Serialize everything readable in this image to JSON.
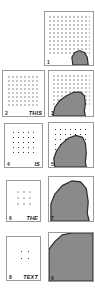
{
  "figure": {
    "caption_words": [
      "THIS",
      "IS",
      "THE",
      "TEXT"
    ],
    "gray_fill": "#8a8a8a",
    "outline": "#2b2b2b",
    "border": "#9a9a9a",
    "background": "#ffffff"
  },
  "panels": [
    {
      "id": "panel-1",
      "index_label": "1",
      "word_label": "",
      "column": "right",
      "row": 1,
      "x": 44,
      "y": 11,
      "w": 50,
      "h": 55,
      "dot_spacing": 4,
      "dot_size": 1,
      "dot_inset": 3,
      "has_dots": true,
      "region_path": "M 29 55 L 28 47 L 31 42 L 36 40 L 41 42 L 44 47 L 45 55 Z",
      "region_coverage_pct": 8
    },
    {
      "id": "panel-2",
      "index_label": "2",
      "word_label": "THIS",
      "column": "left",
      "row": 2,
      "x": 2,
      "y": 70,
      "w": 43,
      "h": 47,
      "dot_spacing": 4,
      "dot_size": 1,
      "dot_inset": 4,
      "has_dots": true,
      "region_path": "",
      "region_coverage_pct": 0
    },
    {
      "id": "panel-3",
      "index_label": "3",
      "word_label": "",
      "column": "right",
      "row": 2,
      "x": 48,
      "y": 70,
      "w": 46,
      "h": 47,
      "dot_spacing": 4,
      "dot_size": 1,
      "dot_inset": 3,
      "has_dots": true,
      "region_path": "M 4 47 L 6 38 L 11 31 L 18 26 L 26 22 L 33 22 L 37 26 L 38 34 L 37 42 L 38 47 Z",
      "region_coverage_pct": 32
    },
    {
      "id": "panel-4",
      "index_label": "4",
      "word_label": "IS",
      "column": "left",
      "row": 3,
      "x": 4,
      "y": 123,
      "w": 39,
      "h": 45,
      "dot_spacing": 5,
      "dot_size": 1,
      "dot_inset": 6,
      "has_dots": true,
      "region_path": "",
      "region_coverage_pct": 0
    },
    {
      "id": "panel-5",
      "index_label": "5",
      "word_label": "",
      "column": "right",
      "row": 3,
      "x": 48,
      "y": 122,
      "w": 46,
      "h": 46,
      "dot_spacing": 5,
      "dot_size": 1,
      "dot_inset": 4,
      "has_dots": true,
      "region_path": "M 6 46 L 5 37 L 8 29 L 13 22 L 20 16 L 28 13 L 35 15 L 38 21 L 39 32 L 38 41 L 39 46 Z",
      "region_coverage_pct": 52
    },
    {
      "id": "panel-6",
      "index_label": "6",
      "word_label": "THE",
      "column": "left",
      "row": 4,
      "x": 6,
      "y": 180,
      "w": 35,
      "h": 42,
      "dot_spacing": 6,
      "dot_size": 1,
      "dot_inset": 8,
      "has_dots": true,
      "region_path": "",
      "region_coverage_pct": 0
    },
    {
      "id": "panel-7",
      "index_label": "7",
      "word_label": "",
      "column": "right",
      "row": 4,
      "x": 48,
      "y": 176,
      "w": 46,
      "h": 46,
      "dot_spacing": 6,
      "dot_size": 1,
      "dot_inset": 5,
      "has_dots": false,
      "region_path": "M 2 46 L 2 28 L 6 18 L 14 9 L 24 4 L 33 5 L 39 12 L 41 26 L 40 38 L 42 46 Z",
      "region_coverage_pct": 74
    },
    {
      "id": "panel-8",
      "index_label": "8",
      "word_label": "TEXT",
      "column": "left",
      "row": 5,
      "x": 6,
      "y": 236,
      "w": 35,
      "h": 45,
      "dot_spacing": 7,
      "dot_size": 1,
      "dot_inset": 11,
      "has_dots": true,
      "region_path": "",
      "region_coverage_pct": 0
    },
    {
      "id": "panel-9",
      "index_label": "9",
      "word_label": "",
      "column": "right",
      "row": 5,
      "x": 48,
      "y": 232,
      "w": 46,
      "h": 50,
      "dot_spacing": 7,
      "dot_size": 1,
      "dot_inset": 6,
      "has_dots": false,
      "region_path": "M 0 50 L 0 17 L 6 9 L 14 2 L 24 0 L 46 0 L 46 50 Z",
      "region_coverage_pct": 93
    }
  ]
}
